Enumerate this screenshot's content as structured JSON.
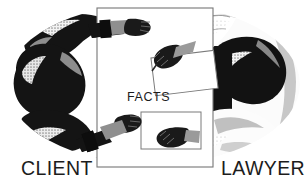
{
  "illustration": {
    "title": "Client and Lawyer exchanging facts across a table",
    "style": "black-and-white halftone line illustration",
    "background_color": "#ffffff",
    "ink_color": "#1a1a1a",
    "midtone_color": "#8d8d8d",
    "light_tone_color": "#c9c9c9"
  },
  "labels": {
    "client": "CLIENT",
    "lawyer": "LAWYER",
    "facts": "FACTS"
  },
  "table": {
    "name": "facts-table",
    "fill": "#ffffff",
    "stroke": "#6e6e6e"
  },
  "documents": [
    {
      "name": "upper-document",
      "fill": "#ffffff",
      "stroke": "#777777"
    },
    {
      "name": "lower-document",
      "fill": "#ffffff",
      "stroke": "#777777"
    }
  ],
  "figures": {
    "left_group": {
      "name": "client-arms",
      "sleeve_tone": "dark",
      "color": "#141414"
    },
    "right_group": {
      "name": "lawyer-arms",
      "sleeve_tone": "light",
      "color": "#f2f2f2"
    }
  }
}
